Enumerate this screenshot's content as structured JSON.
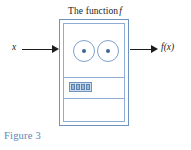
{
  "figure": {
    "title_prefix": "The function",
    "title_symbol": "f",
    "caption": "Figure 3"
  },
  "machine": {
    "name": "function-machine",
    "dials": [
      {
        "name": "dial-left",
        "label": ""
      },
      {
        "name": "dial-right",
        "label": ""
      }
    ],
    "display": {
      "name": "segment-display",
      "cells": [
        "",
        "",
        "",
        ""
      ]
    }
  },
  "input": {
    "label": "x",
    "arrow_name": "input-arrow"
  },
  "output": {
    "label": "f(x)",
    "arrow_name": "output-arrow"
  },
  "colors": {
    "machine_border": "#6e93c0",
    "machine_inner_border": "#8fadd2",
    "dial_dot": "#3f6595",
    "caption": "#5b87ba",
    "arrow": "#1c1c1c",
    "title_text": "#1a1a1a",
    "display_fill": "#cfdcec",
    "display_cell": "#9db7d6"
  }
}
